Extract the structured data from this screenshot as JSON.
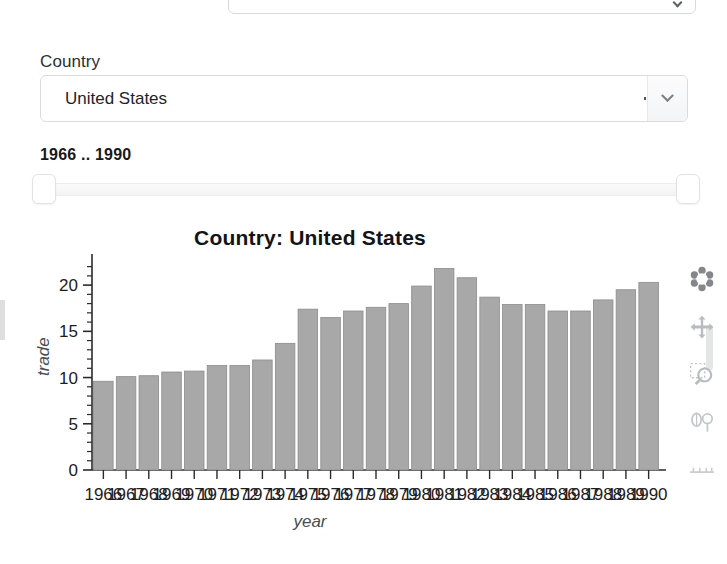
{
  "top_control": {
    "icon": "chevron-down-icon"
  },
  "country_selector": {
    "label": "Country",
    "value": "United States",
    "icon": "chevron-down-icon"
  },
  "year_range": {
    "label": "1966 .. 1990",
    "min": 1966,
    "max": 1990,
    "handle_left": "slider-handle-left",
    "handle_right": "slider-handle-right"
  },
  "toolbar": {
    "items": [
      {
        "name": "plotly-logo-icon",
        "label": "Produced with Plotly"
      },
      {
        "name": "pan-icon",
        "label": "Pan"
      },
      {
        "name": "zoom-box-icon",
        "label": "Box Zoom"
      },
      {
        "name": "lasso-select-icon",
        "label": "Lasso Select"
      },
      {
        "name": "axes-reset-icon",
        "label": "Reset axes"
      }
    ]
  },
  "chart_data": {
    "type": "bar",
    "title": "Country: United States",
    "xlabel": "year",
    "ylabel": "trade",
    "ylim": [
      0,
      22.5
    ],
    "yticks": [
      0,
      5,
      10,
      15,
      20
    ],
    "minor_ticks": true,
    "grid": false,
    "bar_color": "#a8a8a8",
    "bar_edge_color": "#8c8c8c",
    "categories": [
      "1966",
      "1967",
      "1968",
      "1969",
      "1970",
      "1971",
      "1972",
      "1973",
      "1974",
      "1975",
      "1976",
      "1977",
      "1978",
      "1979",
      "1980",
      "1981",
      "1982",
      "1983",
      "1984",
      "1985",
      "1986",
      "1987",
      "1988",
      "1989",
      "1990"
    ],
    "values": [
      9.6,
      10.1,
      10.2,
      10.6,
      10.7,
      11.3,
      11.3,
      11.9,
      13.7,
      17.4,
      16.5,
      17.2,
      17.6,
      18.0,
      19.9,
      21.8,
      20.8,
      18.7,
      17.9,
      17.9,
      17.2,
      17.2,
      18.4,
      19.5,
      20.3
    ]
  }
}
